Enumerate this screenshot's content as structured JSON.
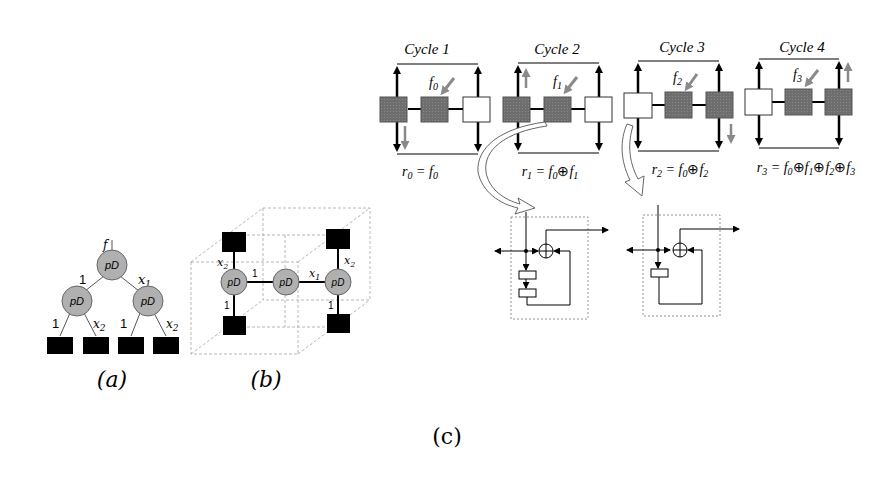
{
  "figure": {
    "panels": {
      "a": {
        "caption": "(a)",
        "root_input_label": "f",
        "node_label": "pD",
        "edge_labels": {
          "root_left": "1",
          "root_right": "x1",
          "left_left": "1",
          "left_right": "x2",
          "right_left": "1",
          "right_right": "x2"
        },
        "leaf_count": 4
      },
      "b": {
        "caption": "(b)",
        "node_label": "pD",
        "edge_labels": {
          "left_top": "x2",
          "left_bottom": "1",
          "center_left": "1",
          "center_right": "x1",
          "right_top": "x2",
          "right_bottom": "1"
        }
      },
      "c": {
        "caption": "(c)",
        "cycles": [
          {
            "title": "Cycle 1",
            "input": "f0",
            "equation": "r0 = f0"
          },
          {
            "title": "Cycle 2",
            "input": "f1",
            "equation": "r1 = f0 ⊕ f1"
          },
          {
            "title": "Cycle 3",
            "input": "f2",
            "equation": "r2 = f0 ⊕ f2"
          },
          {
            "title": "Cycle 4",
            "input": "f3",
            "equation": "r3 = f0 ⊕ f1 ⊕ f2 ⊕ f3"
          }
        ],
        "circuits": [
          {
            "name": "two-register-feedback",
            "registers": 2,
            "xor_symbol": "⊕"
          },
          {
            "name": "one-register-feedback",
            "registers": 1,
            "xor_symbol": "⊕"
          }
        ]
      }
    },
    "colors": {
      "node_fill": "#b0b0b0",
      "leaf_fill": "#000000",
      "shaded_cell": "#707070",
      "gray_arrow": "#8a8a8a",
      "dashed_line": "#999999"
    }
  }
}
